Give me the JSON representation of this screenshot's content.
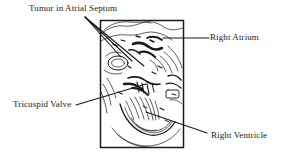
{
  "figure": {
    "type": "labeled-medical-illustration",
    "background_color": "#ffffff",
    "ink_color": "#1a1a1a",
    "frame": {
      "name": "image-frame",
      "x": 100,
      "y": 20,
      "width": 84,
      "height": 128,
      "border_color": "#1a1a1a",
      "border_width": 1.5
    }
  },
  "labels": [
    {
      "id": "tumor",
      "text": "Tumor in Atrial Septum",
      "position": "top-left",
      "x": 29,
      "y": 3
    },
    {
      "id": "right_atrium",
      "text": "Right Atrium",
      "position": "right-upper",
      "x": 210,
      "y": 32
    },
    {
      "id": "tricuspid_valve",
      "text": "Tricuspid Valve",
      "position": "left-lower",
      "x": 13,
      "y": 99
    },
    {
      "id": "right_ventricle",
      "text": "Right Ventricle",
      "position": "right-lower",
      "x": 211,
      "y": 130
    }
  ],
  "leader_lines": [
    {
      "id": "tumor-leader-a",
      "from": [
        85,
        17
      ],
      "to": [
        144,
        66
      ]
    },
    {
      "id": "tumor-leader-b",
      "from": [
        85,
        17
      ],
      "to": [
        121,
        57
      ]
    },
    {
      "id": "tumor-leader-c",
      "from": [
        85,
        17
      ],
      "to": [
        132,
        61
      ]
    },
    {
      "id": "atrium-leader",
      "from": [
        209,
        38
      ],
      "to": [
        163,
        38
      ]
    },
    {
      "id": "tricuspid-leader",
      "from": [
        76,
        105
      ],
      "to": [
        146,
        84
      ]
    },
    {
      "id": "ventricle-leader",
      "from": [
        207,
        133
      ],
      "to": [
        146,
        112
      ]
    }
  ],
  "colors": {
    "ink": "#1a1a1a",
    "paper": "#ffffff",
    "frame": "#1a1a1a"
  }
}
